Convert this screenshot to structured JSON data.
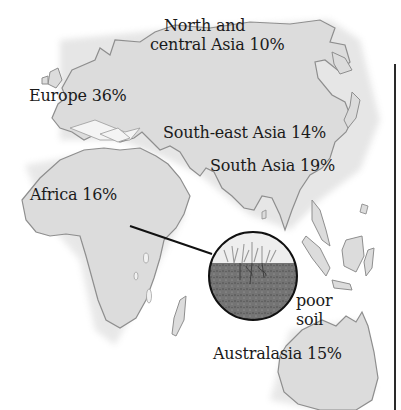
{
  "map": {
    "type": "illustrated region map",
    "colors": {
      "land_fill": "#dcdcdc",
      "land_stroke": "#8e8e8e",
      "background": "#ffffff",
      "text": "#1a1a1a",
      "soil_dark": "#5a5a5a",
      "leader_line": "#111111"
    },
    "regions": [
      {
        "id": "north-central-asia",
        "name": "North and central Asia",
        "value": "10%",
        "line1": "North and",
        "line2": "central Asia 10%"
      },
      {
        "id": "europe",
        "name": "Europe",
        "value": "36%",
        "text": "Europe 36%"
      },
      {
        "id": "southeast-asia",
        "name": "South-east Asia",
        "value": "14%",
        "text": "South-east Asia 14%"
      },
      {
        "id": "south-asia",
        "name": "South Asia",
        "value": "19%",
        "text": "South Asia 19%"
      },
      {
        "id": "africa",
        "name": "Africa",
        "value": "16%",
        "text": "Africa 16%"
      },
      {
        "id": "australasia",
        "name": "Australasia",
        "value": "15%",
        "text": "Australasia 15%"
      }
    ],
    "callout": {
      "icon": "soil-cross-section-icon",
      "line1": "poor",
      "line2": "soil"
    }
  }
}
